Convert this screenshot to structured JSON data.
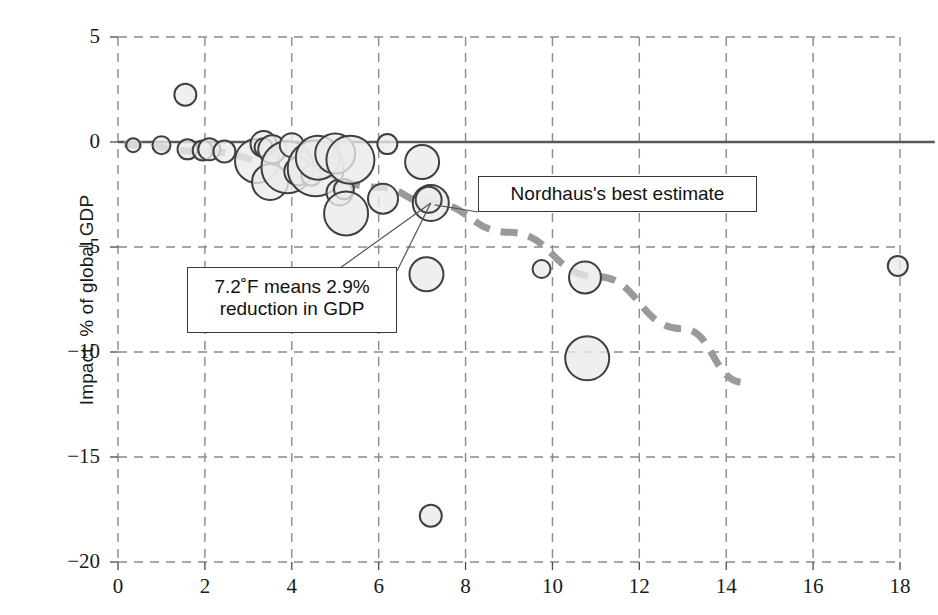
{
  "figure": {
    "title_partial": "",
    "ylabel": "Impact, % of global GDP",
    "xlabel": ""
  },
  "annotations": {
    "nordhaus": "Nordhaus's best estimate",
    "reduction_line1": "7.2˚F means 2.9%",
    "reduction_line2": "reduction in GDP"
  },
  "axes": {
    "x_ticks": [
      "0",
      "2",
      "4",
      "6",
      "8",
      "10",
      "12",
      "14",
      "16",
      "18"
    ],
    "y_ticks": [
      "5",
      "0",
      "−5",
      "−10",
      "−15",
      "−20"
    ]
  },
  "colors": {
    "bubble_fill": "#ebebeb",
    "bubble_stroke": "#3f3f3f",
    "grid": "#8a8a8a",
    "zero_line": "#585858",
    "trend_line": "#9a9a9a",
    "text": "#1a1a1a"
  },
  "chart_data": {
    "type": "scatter",
    "title": "",
    "xlabel": "",
    "ylabel": "Impact, % of global GDP",
    "xlim": [
      0,
      18
    ],
    "ylim": [
      -20,
      5
    ],
    "grid": true,
    "legend": "none",
    "xticks": [
      0,
      2,
      4,
      6,
      8,
      10,
      12,
      14,
      16,
      18
    ],
    "yticks": [
      5,
      0,
      -5,
      -10,
      -15,
      -20
    ],
    "note": "Bubble scatter of climate-damage estimates; marker size encodes study weight. Dashed curve is Nordhaus's best estimate.",
    "series": [
      {
        "name": "Damage estimates (bubble size = weight)",
        "marker": "circle",
        "points": [
          {
            "x": 0.35,
            "y": -0.15,
            "size": 7
          },
          {
            "x": 1.0,
            "y": -0.15,
            "size": 9
          },
          {
            "x": 1.55,
            "y": 2.25,
            "size": 11
          },
          {
            "x": 1.6,
            "y": -0.35,
            "size": 10
          },
          {
            "x": 1.95,
            "y": -0.4,
            "size": 10
          },
          {
            "x": 2.1,
            "y": -0.35,
            "size": 11
          },
          {
            "x": 2.45,
            "y": -0.45,
            "size": 11
          },
          {
            "x": 3.2,
            "y": -0.9,
            "size": 22
          },
          {
            "x": 3.35,
            "y": -0.1,
            "size": 13
          },
          {
            "x": 3.35,
            "y": -0.25,
            "size": 9
          },
          {
            "x": 3.55,
            "y": -0.35,
            "size": 14
          },
          {
            "x": 3.5,
            "y": -1.9,
            "size": 18
          },
          {
            "x": 3.9,
            "y": -1.2,
            "size": 26
          },
          {
            "x": 4.0,
            "y": -0.15,
            "size": 12
          },
          {
            "x": 4.15,
            "y": -1.4,
            "size": 14
          },
          {
            "x": 4.45,
            "y": -1.6,
            "size": 10
          },
          {
            "x": 4.55,
            "y": -1.25,
            "size": 28
          },
          {
            "x": 4.6,
            "y": -0.75,
            "size": 22
          },
          {
            "x": 5.0,
            "y": -0.55,
            "size": 20
          },
          {
            "x": 5.1,
            "y": -2.4,
            "size": 13
          },
          {
            "x": 5.2,
            "y": -2.25,
            "size": 10
          },
          {
            "x": 5.25,
            "y": -3.4,
            "size": 22
          },
          {
            "x": 5.35,
            "y": -0.85,
            "size": 24
          },
          {
            "x": 6.2,
            "y": -0.1,
            "size": 10
          },
          {
            "x": 6.1,
            "y": -2.7,
            "size": 15
          },
          {
            "x": 7.0,
            "y": -0.95,
            "size": 17
          },
          {
            "x": 7.2,
            "y": -2.9,
            "size": 18
          },
          {
            "x": 7.15,
            "y": -2.75,
            "size": 13
          },
          {
            "x": 7.1,
            "y": -6.3,
            "size": 17
          },
          {
            "x": 7.2,
            "y": -17.8,
            "size": 11
          },
          {
            "x": 9.75,
            "y": -6.05,
            "size": 9
          },
          {
            "x": 10.75,
            "y": -6.45,
            "size": 16
          },
          {
            "x": 10.8,
            "y": -10.3,
            "size": 22
          },
          {
            "x": 17.95,
            "y": -5.9,
            "size": 10
          }
        ]
      }
    ],
    "trend_curve": {
      "name": "Nordhaus's best estimate",
      "style": "dashed",
      "points": [
        {
          "x": 0.15,
          "y": -0.12
        },
        {
          "x": 2.0,
          "y": -0.45
        },
        {
          "x": 4.0,
          "y": -1.15
        },
        {
          "x": 6.0,
          "y": -2.15
        },
        {
          "x": 7.2,
          "y": -2.9
        },
        {
          "x": 9.0,
          "y": -4.3
        },
        {
          "x": 11.0,
          "y": -6.4
        },
        {
          "x": 13.0,
          "y": -8.9
        },
        {
          "x": 14.4,
          "y": -11.45
        }
      ]
    },
    "zero_line": {
      "y": 0,
      "style": "solid",
      "x_from": 0,
      "x_to": 18.8
    }
  }
}
